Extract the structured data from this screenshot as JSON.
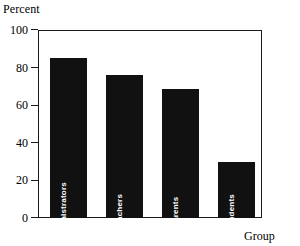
{
  "chart_data": {
    "type": "bar",
    "title": "",
    "xlabel": "Group",
    "ylabel": "Percent",
    "categories": [
      "Administrators",
      "Teachers",
      "Parents",
      "Students"
    ],
    "values": [
      85,
      76,
      68.5,
      30
    ],
    "ylim": [
      0,
      100
    ],
    "yticks": [
      0,
      20,
      40,
      60,
      80,
      100
    ],
    "ytick_labels": [
      "0",
      "20",
      "40",
      "60",
      "80",
      "100"
    ],
    "grid": false,
    "legend": null,
    "bar_color": "#111111",
    "bar_label_color": "#ffffff",
    "axis_color": "#1a1a1a",
    "background": "#ffffff",
    "bar_labels_inside": true,
    "bar_label_orientation": "vertical"
  },
  "axes": {
    "y_title": "Percent",
    "x_title": "Group"
  }
}
